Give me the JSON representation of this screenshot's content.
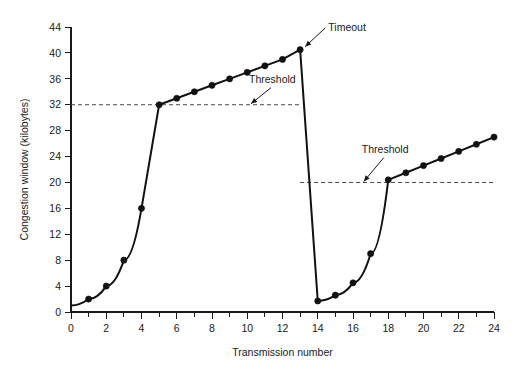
{
  "chart_data": {
    "type": "line",
    "title": "",
    "xlabel": "Transmission number",
    "ylabel": "Congestion window (kilobytes)",
    "xlim": [
      0,
      24
    ],
    "ylim": [
      0,
      44
    ],
    "grid": false,
    "legend_position": "none",
    "x_ticks_major": [
      0,
      2,
      4,
      6,
      8,
      10,
      12,
      14,
      16,
      18,
      20,
      22,
      24
    ],
    "x_ticks_minor": [
      1,
      3,
      5,
      7,
      9,
      11,
      13,
      15,
      17,
      19,
      21,
      23
    ],
    "x_tick_labels": [
      "0",
      "2",
      "4",
      "6",
      "8",
      "10",
      "12",
      "14",
      "16",
      "18",
      "20",
      "22",
      "24"
    ],
    "y_ticks": [
      0,
      4,
      8,
      12,
      16,
      20,
      24,
      28,
      32,
      36,
      40,
      44
    ],
    "y_tick_labels": [
      "0",
      "4",
      "8",
      "12",
      "16",
      "20",
      "24",
      "28",
      "32",
      "36",
      "40",
      "44"
    ],
    "series": [
      {
        "name": "Congestion window",
        "marker": "filled-circle",
        "color": "#111111",
        "x": [
          0,
          1,
          2,
          3,
          4,
          5,
          6,
          7,
          8,
          9,
          10,
          11,
          12,
          13,
          14,
          15,
          16,
          17,
          18,
          19,
          20,
          21,
          22,
          23,
          24
        ],
        "values": [
          1,
          2,
          4,
          8,
          16,
          32,
          33,
          34,
          35,
          36,
          37,
          38,
          39,
          40.5,
          1.7,
          2.6,
          4.5,
          9,
          20.4,
          21.5,
          22.6,
          23.7,
          24.8,
          25.9,
          27
        ]
      }
    ],
    "markers_hidden_at_x": [
      6,
      19,
      20,
      21,
      22,
      23
    ],
    "annotations": [
      {
        "id": "threshold-1",
        "label": "Threshold",
        "value": 32,
        "x_start": 0,
        "x_end": 13,
        "style": "dashed-horizontal",
        "label_x": 10.1,
        "label_y": 35.4
      },
      {
        "id": "threshold-2",
        "label": "Threshold",
        "value": 20,
        "x_start": 13,
        "x_end": 24,
        "style": "dashed-horizontal",
        "label_x": 16.5,
        "label_y": 24.6
      },
      {
        "id": "timeout",
        "label": "Timeout",
        "x_point": 13,
        "y_point": 40.5,
        "style": "arrow",
        "label_x": 14.6,
        "label_y": 43.4
      }
    ]
  },
  "colors": {
    "background": "#ffffff",
    "line": "#111111",
    "axis": "#1a1a1a",
    "threshold": "#4a4a4a",
    "text": "#1a1a1a"
  }
}
